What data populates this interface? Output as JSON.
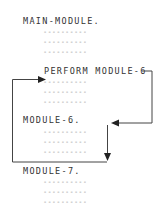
{
  "diagram": {
    "blocks": [
      {
        "label": "MAIN-MODULE.",
        "lines": [
          "----------",
          "----------",
          "----------"
        ]
      },
      {
        "label": "PERFORM MODULE-6",
        "lines": [
          "----------",
          "----------",
          "----------"
        ]
      },
      {
        "label": "MODULE-6.",
        "lines": [
          "----------",
          "----------",
          "----------"
        ]
      },
      {
        "label": "MODULE-7.",
        "lines": [
          "----------",
          "----------",
          "----------"
        ]
      }
    ],
    "arrows": [
      {
        "from": "PERFORM MODULE-6",
        "to": "MODULE-6.",
        "meaning": "control transfers to MODULE-6"
      },
      {
        "from": "MODULE-6. end",
        "to": "statement after PERFORM",
        "meaning": "control returns after PERFORM"
      }
    ]
  }
}
